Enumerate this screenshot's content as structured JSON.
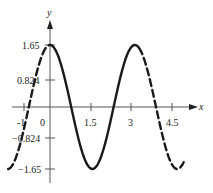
{
  "chart_data": {
    "type": "line",
    "title": "",
    "xlabel": "x",
    "ylabel": "y",
    "function": "y = 1.65 cos(2x)",
    "x_ticks": [
      "-1",
      "0",
      "1.5",
      "3",
      "4.5"
    ],
    "y_ticks": [
      "1.65",
      "0.824",
      "-0.824",
      "-1.65"
    ],
    "xlim": [
      -1.55,
      5.4
    ],
    "ylim": [
      -2.0,
      2.3
    ],
    "grid": false,
    "legend": "none",
    "series": [
      {
        "name": "dashed-left",
        "style": "dashed",
        "x": [
          -1.55,
          -1.25,
          -1.0,
          -0.75,
          -0.5,
          -0.25,
          0.0
        ],
        "y": [
          -1.65,
          -1.32,
          -0.69,
          0.12,
          0.89,
          1.45,
          1.65
        ]
      },
      {
        "name": "solid-main",
        "style": "solid",
        "x": [
          0.0,
          0.39,
          0.785,
          1.18,
          1.57,
          1.96,
          2.36,
          2.75,
          3.14,
          3.3
        ],
        "y": [
          1.65,
          1.17,
          0.0,
          -1.17,
          -1.65,
          -1.17,
          0.0,
          1.17,
          1.65,
          1.6
        ]
      },
      {
        "name": "dashed-right",
        "style": "dashed",
        "x": [
          3.3,
          3.53,
          3.93,
          4.32,
          4.71,
          4.95
        ],
        "y": [
          1.6,
          1.17,
          0.0,
          -1.17,
          -1.65,
          -1.34
        ]
      }
    ]
  },
  "labels": {
    "x_axis": "x",
    "y_axis": "y",
    "tick_neg1": "-1",
    "tick_0": "0",
    "tick_1_5": "1.5",
    "tick_3": "3",
    "tick_4_5": "4.5",
    "tick_1_65": "1.65",
    "tick_0_824": "0.824",
    "tick_neg0_824": "−0.824",
    "tick_neg1_65": "−1.65"
  },
  "colors": {
    "axis": "#555555",
    "curve": "#1a1a1a",
    "text": "#222222"
  }
}
